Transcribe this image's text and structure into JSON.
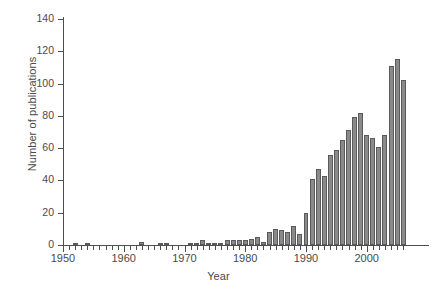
{
  "chart_data": {
    "type": "bar",
    "title": "",
    "xlabel": "Year",
    "ylabel": "Number of publications",
    "xlim": [
      1949,
      2007
    ],
    "ylim": [
      0,
      140
    ],
    "grid": false,
    "legend": null,
    "ytick_labels": [
      "0",
      "20",
      "40",
      "60",
      "80",
      "100",
      "120",
      "140"
    ],
    "ytick_values": [
      0,
      20,
      40,
      60,
      80,
      100,
      120,
      140
    ],
    "xtick_labels": [
      "1950",
      "1960",
      "1970",
      "1980",
      "1990",
      "2000"
    ],
    "xtick_values": [
      1950,
      1960,
      1970,
      1980,
      1990,
      2000
    ],
    "bar_color": "#8a8a8a",
    "bar_edge_color": "#5a5a5a",
    "axis_color": "#4d4d4d",
    "background_color": "#ffffff",
    "categories": [
      1950,
      1951,
      1952,
      1953,
      1954,
      1955,
      1956,
      1957,
      1958,
      1959,
      1960,
      1961,
      1962,
      1963,
      1964,
      1965,
      1966,
      1967,
      1968,
      1969,
      1970,
      1971,
      1972,
      1973,
      1974,
      1975,
      1976,
      1977,
      1978,
      1979,
      1980,
      1981,
      1982,
      1983,
      1984,
      1985,
      1986,
      1987,
      1988,
      1989,
      1990,
      1991,
      1992,
      1993,
      1994,
      1995,
      1996,
      1997,
      1998,
      1999,
      2000,
      2001,
      2002,
      2003,
      2004,
      2005,
      2006
    ],
    "values": [
      0,
      0,
      1,
      0,
      1,
      0,
      0,
      0,
      0,
      0,
      0,
      0,
      0,
      2,
      0,
      0,
      1,
      1,
      0,
      0,
      0,
      1,
      1,
      3,
      1,
      1,
      1,
      3,
      3,
      3,
      3,
      4,
      5,
      2,
      8,
      10,
      9,
      8,
      12,
      7,
      20,
      41,
      47,
      43,
      56,
      59,
      65,
      71,
      79,
      82,
      68,
      66,
      61,
      68,
      111,
      115,
      102
    ]
  }
}
